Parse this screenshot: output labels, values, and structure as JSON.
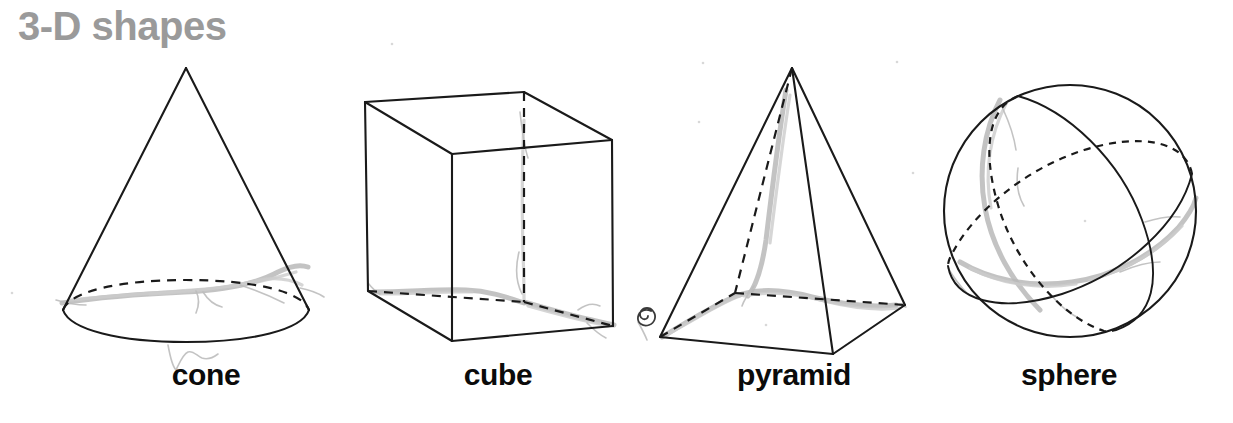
{
  "poster": {
    "title": "3-D shapes",
    "title_color": "#9a9a9a",
    "background_color": "#ffffff",
    "ink_color": "#1a1a1a",
    "label_color": "#0b0b0b",
    "pencil_smudge_color": "#b9b9b9"
  },
  "shapes": [
    {
      "name": "cone",
      "label": "cone",
      "drawing_style": "line-drawing-with-dashed-hidden-edges",
      "has_pencil_smudge": true
    },
    {
      "name": "cube",
      "label": "cube",
      "drawing_style": "line-drawing-with-dashed-hidden-edges",
      "has_pencil_smudge": true
    },
    {
      "name": "pyramid",
      "label": "pyramid",
      "drawing_style": "line-drawing-with-dashed-hidden-edges",
      "has_pencil_smudge": true
    },
    {
      "name": "sphere",
      "label": "sphere",
      "drawing_style": "circle-with-two-great-circle-ellipses",
      "has_pencil_smudge": true
    }
  ],
  "annotations": {
    "spiral_doodle": "small hand-drawn spiral near pyramid base left corner"
  }
}
